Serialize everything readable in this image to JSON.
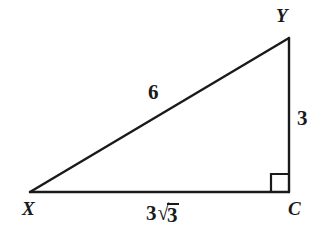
{
  "figure": {
    "kind": "right-triangle-diagram",
    "background_color": "#ffffff",
    "stroke_color": "#1a1a1a",
    "stroke_width_px": 2,
    "width_px": 322,
    "height_px": 234
  },
  "triangle": {
    "vertices": [
      {
        "name": "X",
        "label": "X",
        "x": 30,
        "y": 192,
        "angle_marker": "none"
      },
      {
        "name": "C",
        "label": "C",
        "x": 289,
        "y": 192,
        "angle_marker": "right-angle-square"
      },
      {
        "name": "Y",
        "label": "Y",
        "x": 289,
        "y": 38,
        "angle_marker": "none"
      }
    ],
    "right_angle_at": "C",
    "right_angle_marker_size_px": 18,
    "sides": [
      {
        "name": "hypotenuse",
        "from": "X",
        "to": "Y",
        "label": "6",
        "label_type": "plain"
      },
      {
        "name": "vertical-leg",
        "from": "Y",
        "to": "C",
        "label": "3",
        "label_type": "plain"
      },
      {
        "name": "horizontal-leg",
        "from": "X",
        "to": "C",
        "label": "3√3",
        "label_type": "radical",
        "radical_coefficient": "3",
        "radicand": "3"
      }
    ]
  },
  "labels": {
    "vertex_y": "Y",
    "vertex_x": "X",
    "vertex_c": "C",
    "side_hypotenuse": "6",
    "side_vertical": "3",
    "side_base_coefficient": "3",
    "side_base_radical_sign": "√",
    "side_base_radicand": "3"
  }
}
